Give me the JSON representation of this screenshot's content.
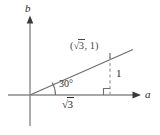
{
  "figure": {
    "kind": "coordinate-diagram",
    "background_color": "#ffffff",
    "stroke_color": "#5a5a5a",
    "text_color": "#2b2b2b",
    "muted_text_color": "#4a4a4a",
    "axes": {
      "vertical_label": "b",
      "horizontal_label": "a",
      "origin": {
        "x": 30,
        "y": 95
      }
    },
    "point": {
      "label_full": "(√3, 1)",
      "label_open_paren": "(",
      "label_radical_sign": "√",
      "label_radical_arg": "3",
      "label_after": ", 1)",
      "x": 110,
      "y": 57
    },
    "angle": {
      "label": "30°",
      "degrees": 30
    },
    "legs": {
      "adjacent_label_radical_sign": "√",
      "adjacent_label_radical_arg": "3",
      "adjacent_label_full": "√3",
      "opposite_label": "1"
    },
    "right_angle_marker": {
      "name": "right-angle-square",
      "present": true
    }
  }
}
